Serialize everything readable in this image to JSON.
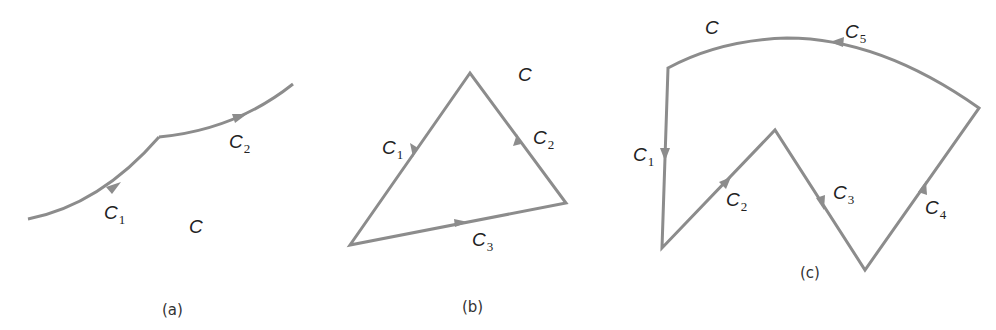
{
  "figure": {
    "panels": [
      {
        "id": "a",
        "caption": "(a)",
        "region_label": "C",
        "segments": [
          {
            "name": "C",
            "subscript": "1"
          },
          {
            "name": "C",
            "subscript": "2"
          }
        ]
      },
      {
        "id": "b",
        "caption": "(b)",
        "region_label": "C",
        "segments": [
          {
            "name": "C",
            "subscript": "1"
          },
          {
            "name": "C",
            "subscript": "2"
          },
          {
            "name": "C",
            "subscript": "3"
          }
        ]
      },
      {
        "id": "c",
        "caption": "(c)",
        "region_label": "C",
        "segments": [
          {
            "name": "C",
            "subscript": "1"
          },
          {
            "name": "C",
            "subscript": "2"
          },
          {
            "name": "C",
            "subscript": "3"
          },
          {
            "name": "C",
            "subscript": "4"
          },
          {
            "name": "C",
            "subscript": "5"
          }
        ]
      }
    ],
    "colors": {
      "stroke": "#8c8c8c",
      "text": "#222222"
    }
  }
}
